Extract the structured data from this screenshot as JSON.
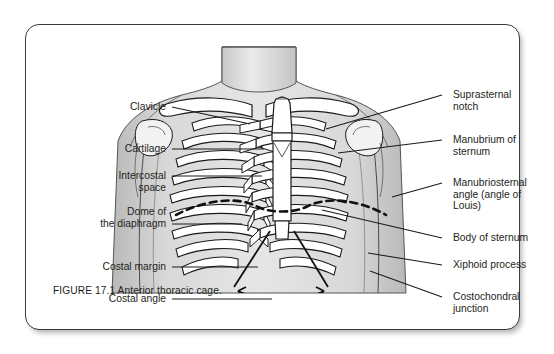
{
  "figure": {
    "caption": "FIGURE 17.1 Anterior thoracic cage.",
    "title": "Anterior thoracic cage",
    "number": "17.1",
    "illustration": "anterior-thoracic-cage-line-drawing",
    "colors": {
      "border": "#3b3b3b",
      "background": "#ffffff",
      "ink": "#231f20",
      "skin_shade": "#d4d4d4",
      "bone_fill": "#ffffff",
      "leader_line": "#1a1a1a"
    }
  },
  "labels_left": [
    {
      "text": "Clavicle",
      "x": 52,
      "y": 76,
      "w": 88,
      "leader": {
        "x1": 146,
        "y1": 82,
        "x2": 224,
        "y2": 99
      }
    },
    {
      "text": "Cartilage",
      "x": 42,
      "y": 118,
      "w": 98,
      "leader": {
        "x1": 146,
        "y1": 124,
        "x2": 238,
        "y2": 124
      }
    },
    {
      "text": "Intercostal\nspace",
      "x": 30,
      "y": 145,
      "w": 110,
      "leader": {
        "x1": 146,
        "y1": 151,
        "x2": 236,
        "y2": 151
      }
    },
    {
      "text": "Dome of\nthe diaphragm",
      "x": 18,
      "y": 181,
      "w": 122,
      "leader": {
        "x1": 146,
        "y1": 199,
        "x2": 216,
        "y2": 199
      }
    },
    {
      "text": "Costal margin",
      "x": 26,
      "y": 236,
      "w": 114,
      "leader": {
        "x1": 146,
        "y1": 242,
        "x2": 232,
        "y2": 242
      }
    },
    {
      "text": "Costal angle",
      "x": 34,
      "y": 268,
      "w": 106,
      "leader": {
        "x1": 146,
        "y1": 274,
        "x2": 246,
        "y2": 274
      }
    }
  ],
  "labels_right": [
    {
      "text": "Suprasternal\nnotch",
      "x": 427,
      "y": 64,
      "w": 112,
      "leader": {
        "x1": 416,
        "y1": 70,
        "x2": 300,
        "y2": 104
      }
    },
    {
      "text": "Manubrium of\nsternum",
      "x": 427,
      "y": 109,
      "w": 112,
      "leader": {
        "x1": 416,
        "y1": 115,
        "x2": 312,
        "y2": 128
      }
    },
    {
      "text": "Manubriosternal\nangle (angle of\nLouis)",
      "x": 427,
      "y": 152,
      "w": 118,
      "leader": {
        "x1": 416,
        "y1": 158,
        "x2": 366,
        "y2": 172
      }
    },
    {
      "text": "Body of sternum",
      "x": 427,
      "y": 207,
      "w": 118,
      "leader": {
        "x1": 416,
        "y1": 213,
        "x2": 296,
        "y2": 185
      }
    },
    {
      "text": "Xiphoid process",
      "x": 427,
      "y": 234,
      "w": 118,
      "leader": {
        "x1": 416,
        "y1": 240,
        "x2": 342,
        "y2": 228
      }
    },
    {
      "text": "Costochondral\njunction",
      "x": 427,
      "y": 266,
      "w": 118,
      "leader": {
        "x1": 416,
        "y1": 272,
        "x2": 344,
        "y2": 246
      }
    }
  ]
}
